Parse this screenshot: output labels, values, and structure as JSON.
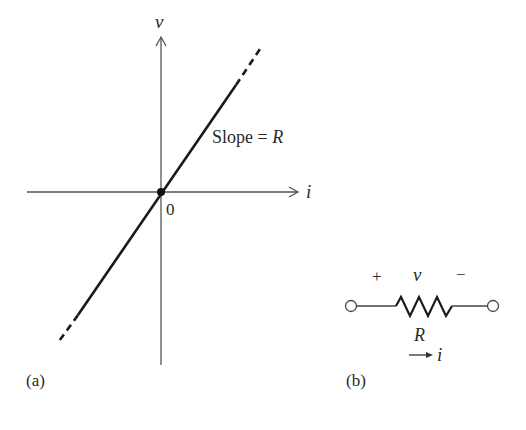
{
  "figure_a": {
    "panel_label": "(a)",
    "y_axis_label": "v",
    "x_axis_label": "i",
    "origin_label": "0",
    "slope_label_prefix": "Slope = ",
    "slope_label_var": "R"
  },
  "figure_b": {
    "panel_label": "(b)",
    "plus_sign": "+",
    "voltage_label": "v",
    "minus_sign": "−",
    "resistor_label": "R",
    "current_label": "i"
  },
  "colors": {
    "ink": "#1a1a1a",
    "axis": "#555555"
  }
}
